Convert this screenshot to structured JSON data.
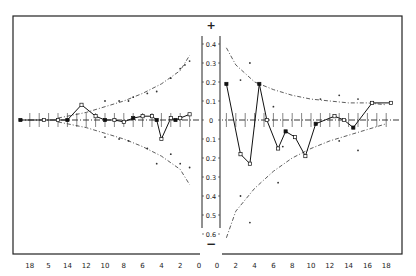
{
  "chart_data": {
    "type": "line",
    "title": "",
    "layout": "mirrored two-panel plot with shared central y-axis",
    "y_axis": {
      "labels_positive": [
        "0.4",
        "0.3",
        "0.2",
        "0.1"
      ],
      "zero_label": "0",
      "labels_negative": [
        "0.1",
        "0.2",
        "0.3",
        "0.4",
        "0.5",
        "0.6"
      ],
      "top_symbol": "+",
      "bottom_symbol": "−",
      "ylim": [
        -0.65,
        0.45
      ]
    },
    "panels": [
      {
        "name": "left",
        "x_tick_labels": [
          "18",
          "5",
          "14",
          "12",
          "10",
          "8",
          "6",
          "4",
          "2",
          "0"
        ],
        "x_direction": "decreasing to the right",
        "xlim": [
          19,
          0
        ],
        "series": {
          "name": "observed",
          "x": [
            19,
            16.5,
            15,
            14,
            12.5,
            11,
            10,
            9,
            8,
            7,
            6,
            5,
            4.5,
            4,
            3,
            2.5,
            2,
            1
          ],
          "y": [
            0,
            0,
            0,
            0,
            0.08,
            0.02,
            0,
            0,
            -0.01,
            0.01,
            0.02,
            0.02,
            0,
            -0.1,
            0.01,
            0,
            0.01,
            0.03
          ]
        },
        "confidence_band": {
          "x": [
            15,
            12,
            10,
            8,
            6,
            4,
            2,
            1
          ],
          "upper": [
            0.01,
            0.04,
            0.07,
            0.1,
            0.14,
            0.19,
            0.26,
            0.34
          ],
          "lower": [
            -0.01,
            -0.04,
            -0.07,
            -0.1,
            -0.14,
            -0.19,
            -0.26,
            -0.34
          ]
        },
        "scatter": {
          "x": [
            10,
            8.5,
            7.5,
            7,
            5.5,
            4.5,
            3,
            2,
            1.5,
            1,
            10,
            8.5,
            7.5,
            5.5,
            4.5,
            3,
            2,
            1
          ],
          "y": [
            0.1,
            0.1,
            0.1,
            0.12,
            0.14,
            0.15,
            0.22,
            0.27,
            0.29,
            0.31,
            -0.09,
            -0.1,
            -0.11,
            -0.15,
            -0.23,
            -0.18,
            -0.23,
            -0.25
          ]
        }
      },
      {
        "name": "right",
        "x_tick_labels": [
          "0",
          "2",
          "4",
          "6",
          "8",
          "10",
          "12",
          "14",
          "16",
          "18"
        ],
        "x_direction": "increasing to the right",
        "xlim": [
          0,
          19
        ],
        "series": {
          "name": "observed",
          "x": [
            1,
            2.5,
            3.5,
            4.5,
            5.3,
            6.5,
            7.3,
            8.3,
            9.4,
            10.5,
            12.5,
            13.5,
            14.5,
            16.5,
            18.5
          ],
          "y": [
            0.19,
            -0.18,
            -0.23,
            0.19,
            0,
            -0.15,
            -0.06,
            -0.09,
            -0.19,
            -0.02,
            0.02,
            0,
            -0.04,
            0.09,
            0.09
          ]
        },
        "confidence_band": {
          "x": [
            1,
            2,
            4,
            6,
            8,
            10,
            12,
            14,
            16,
            18
          ],
          "upper": [
            0.38,
            0.29,
            0.2,
            0.16,
            0.13,
            0.11,
            0.1,
            0.09,
            0.09,
            0.08
          ],
          "lower": [
            -0.62,
            -0.48,
            -0.36,
            -0.27,
            -0.2,
            -0.15,
            -0.11,
            -0.08,
            -0.05,
            -0.02
          ]
        },
        "scatter": {
          "x": [
            2.5,
            3.5,
            6,
            11,
            13,
            15,
            2.5,
            3.5,
            6.5,
            7,
            13,
            15
          ],
          "y": [
            0.21,
            0.3,
            0.07,
            0.11,
            0.13,
            0.11,
            -0.4,
            -0.54,
            -0.33,
            -0.14,
            -0.11,
            -0.16
          ]
        }
      }
    ],
    "grid": false,
    "legend": null
  }
}
